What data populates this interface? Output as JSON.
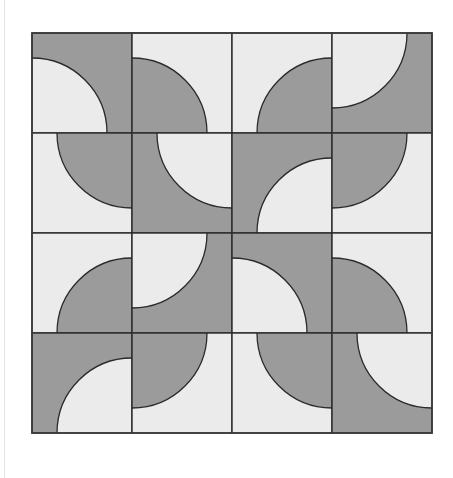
{
  "figure": {
    "grid": {
      "rows": 4,
      "cols": 4,
      "origin_x": 32,
      "origin_y": 33,
      "tile_size": 100,
      "arc_radius": 75
    },
    "colors": {
      "dark": "#9b9b9b",
      "light": "#ebebeb",
      "stroke": "#2a2a2a",
      "background": "#ffffff"
    },
    "tiles": [
      {
        "row": 0,
        "col": 0,
        "corner": "bl",
        "inside": "light"
      },
      {
        "row": 0,
        "col": 1,
        "corner": "bl",
        "inside": "dark"
      },
      {
        "row": 0,
        "col": 2,
        "corner": "br",
        "inside": "dark"
      },
      {
        "row": 0,
        "col": 3,
        "corner": "tl",
        "inside": "light"
      },
      {
        "row": 1,
        "col": 0,
        "corner": "tr",
        "inside": "dark"
      },
      {
        "row": 1,
        "col": 1,
        "corner": "tr",
        "inside": "light"
      },
      {
        "row": 1,
        "col": 2,
        "corner": "br",
        "inside": "light"
      },
      {
        "row": 1,
        "col": 3,
        "corner": "tl",
        "inside": "dark"
      },
      {
        "row": 2,
        "col": 0,
        "corner": "br",
        "inside": "dark"
      },
      {
        "row": 2,
        "col": 1,
        "corner": "tl",
        "inside": "light"
      },
      {
        "row": 2,
        "col": 2,
        "corner": "bl",
        "inside": "light"
      },
      {
        "row": 2,
        "col": 3,
        "corner": "bl",
        "inside": "dark"
      },
      {
        "row": 3,
        "col": 0,
        "corner": "br",
        "inside": "light"
      },
      {
        "row": 3,
        "col": 1,
        "corner": "tl",
        "inside": "dark"
      },
      {
        "row": 3,
        "col": 2,
        "corner": "tr",
        "inside": "dark"
      },
      {
        "row": 3,
        "col": 3,
        "corner": "tr",
        "inside": "light"
      }
    ]
  }
}
